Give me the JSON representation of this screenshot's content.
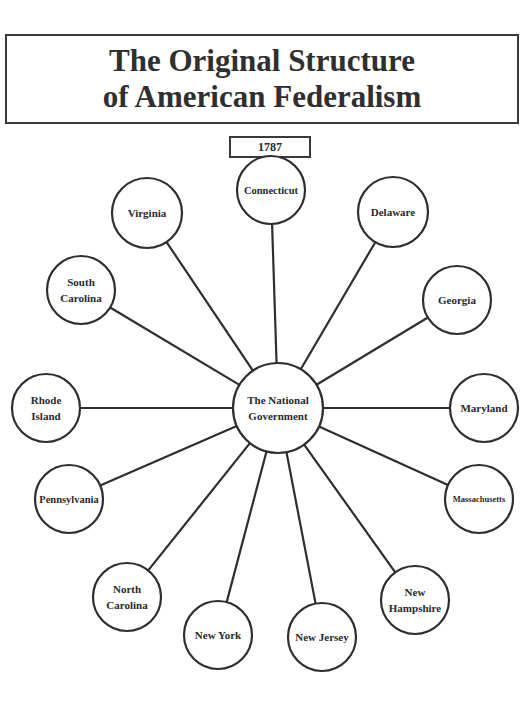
{
  "title": {
    "line1": "The Original Structure",
    "line2": "of American Federalism"
  },
  "year": "1787",
  "center_node": {
    "id": "national-government",
    "label_lines": [
      "The National",
      "Government"
    ]
  },
  "state_nodes": [
    {
      "id": "connecticut",
      "label_lines": [
        "Connecticut"
      ]
    },
    {
      "id": "virginia",
      "label_lines": [
        "Virginia"
      ]
    },
    {
      "id": "delaware",
      "label_lines": [
        "Delaware"
      ]
    },
    {
      "id": "south-carolina",
      "label_lines": [
        "South",
        "Carolina"
      ]
    },
    {
      "id": "georgia",
      "label_lines": [
        "Georgia"
      ]
    },
    {
      "id": "rhode-island",
      "label_lines": [
        "Rhode",
        "Island"
      ]
    },
    {
      "id": "maryland",
      "label_lines": [
        "Maryland"
      ]
    },
    {
      "id": "pennsylvania",
      "label_lines": [
        "Pennsylvania"
      ]
    },
    {
      "id": "massachusetts",
      "label_lines": [
        "Massachusetts"
      ]
    },
    {
      "id": "north-carolina",
      "label_lines": [
        "North",
        "Carolina"
      ]
    },
    {
      "id": "new-york",
      "label_lines": [
        "New York"
      ]
    },
    {
      "id": "new-jersey",
      "label_lines": [
        "New Jersey"
      ]
    },
    {
      "id": "new-hampshire",
      "label_lines": [
        "New",
        "Hampshire"
      ]
    }
  ],
  "edges": [
    [
      "national-government",
      "connecticut"
    ],
    [
      "national-government",
      "virginia"
    ],
    [
      "national-government",
      "delaware"
    ],
    [
      "national-government",
      "south-carolina"
    ],
    [
      "national-government",
      "georgia"
    ],
    [
      "national-government",
      "rhode-island"
    ],
    [
      "national-government",
      "maryland"
    ],
    [
      "national-government",
      "pennsylvania"
    ],
    [
      "national-government",
      "massachusetts"
    ],
    [
      "national-government",
      "north-carolina"
    ],
    [
      "national-government",
      "new-york"
    ],
    [
      "national-government",
      "new-jersey"
    ],
    [
      "national-government",
      "new-hampshire"
    ]
  ],
  "colors": {
    "stroke": "#2e2e2e",
    "text": "#2a2a2a",
    "background": "#ffffff"
  }
}
